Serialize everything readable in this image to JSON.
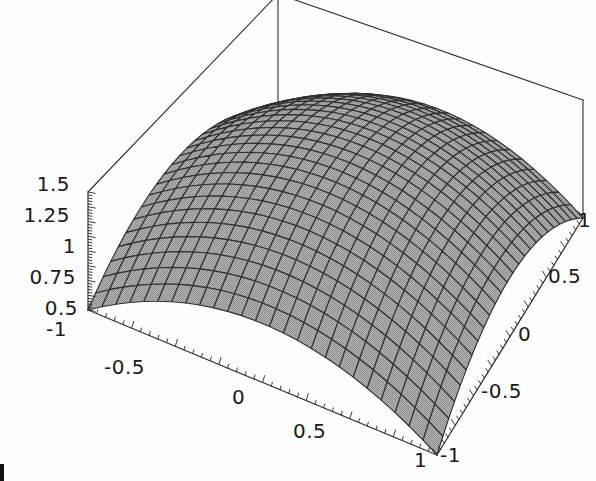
{
  "chart_data": {
    "type": "surface3d",
    "title": "",
    "function": "z = 1.5 - 0.5*(x^2 + y^2)",
    "xlabel": "",
    "ylabel": "",
    "zlabel": "",
    "xlim": [
      -1,
      1
    ],
    "ylim": [
      -1,
      1
    ],
    "zlim": [
      0.5,
      1.5
    ],
    "mesh_divisions": [
      25,
      25
    ],
    "grid": false,
    "legend": null,
    "surface_color": "#a8a8a8",
    "mesh_color": "#303030",
    "box_color": "#303030",
    "axes": {
      "z": {
        "name": "z-axis",
        "ticks": [
          1.5,
          1.25,
          1,
          0.75,
          0.5
        ],
        "tick_labels": [
          "1.5",
          "1.25",
          "1",
          "0.75",
          "0.5"
        ]
      },
      "x_front_left": {
        "name": "x-axis",
        "ticks": [
          -1,
          -0.5,
          0,
          0.5,
          1
        ],
        "tick_labels": [
          "-1",
          "-0.5",
          "0",
          "0.5",
          "1"
        ]
      },
      "y_front_right": {
        "name": "y-axis",
        "ticks": [
          -1,
          -0.5,
          0,
          0.5,
          1
        ],
        "tick_labels": [
          "-1",
          "-0.5",
          "0",
          "0.5",
          "1"
        ]
      }
    },
    "surface_values": {
      "corners": [
        {
          "x": -1,
          "y": -1,
          "z": 0.5
        },
        {
          "x": 1,
          "y": -1,
          "z": 0.5
        },
        {
          "x": 1,
          "y": 1,
          "z": 0.5
        },
        {
          "x": -1,
          "y": 1,
          "z": 0.5
        }
      ],
      "peak": {
        "x": 0,
        "y": 0,
        "z": 1.5
      }
    }
  },
  "labels": {
    "z_15": "1.5",
    "z_125": "1.25",
    "z_1": "1",
    "z_075": "0.75",
    "z_05": "0.5",
    "x_neg1": "-1",
    "x_neg05": "-0.5",
    "x_0": "0",
    "x_05": "0.5",
    "x_1": "1",
    "y_neg1": "-1",
    "y_neg05": "-0.5",
    "y_0": "0",
    "y_05": "0.5",
    "y_1": "1"
  }
}
